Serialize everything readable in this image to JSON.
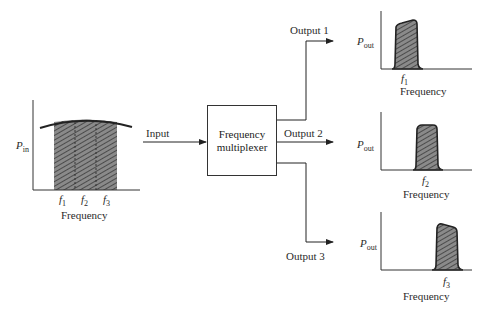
{
  "input_spectrum": {
    "ylabel": "P",
    "ylabel_sub": "in",
    "xlabel": "Frequency",
    "ticks": [
      {
        "f": "f",
        "sub": "1"
      },
      {
        "f": "f",
        "sub": "2"
      },
      {
        "f": "f",
        "sub": "3"
      }
    ]
  },
  "block": {
    "input_label": "Input",
    "title_line1": "Frequency",
    "title_line2": "multiplexer"
  },
  "outputs": [
    {
      "label": "Output 1",
      "ylabel": "P",
      "ylabel_sub": "out",
      "tick": "f",
      "tick_sub": "1",
      "xlabel": "Frequency"
    },
    {
      "label": "Output 2",
      "ylabel": "P",
      "ylabel_sub": "out",
      "tick": "f",
      "tick_sub": "2",
      "xlabel": "Frequency"
    },
    {
      "label": "Output 3",
      "ylabel": "P",
      "ylabel_sub": "out",
      "tick": "f",
      "tick_sub": "3",
      "xlabel": "Frequency"
    }
  ],
  "colors": {
    "line": "#333333",
    "fill": "#6e6e6e"
  }
}
